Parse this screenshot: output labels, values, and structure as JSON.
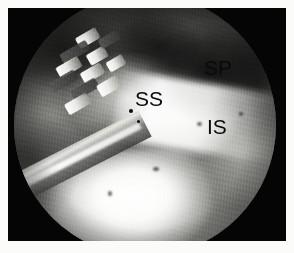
{
  "figure": {
    "kind": "arthroscopic-photograph",
    "modality_label": "shoulder arthroscopy",
    "frame": {
      "background_color": "#ffffff",
      "photo_background_color": "#050505",
      "width_px": 294,
      "height_px": 253,
      "margin_px": 8
    },
    "scope_field": {
      "shape": "circle",
      "diameter_px": 262,
      "cropped_edges": "top-and-bottom"
    },
    "labels": [
      {
        "id": "sp",
        "text": "SP",
        "meaning": "subscapularis / supraspinatus region marker",
        "color": "#0a0a0a",
        "x": 196,
        "y": 49
      },
      {
        "id": "ss",
        "text": "SS",
        "meaning": "supraspinatus tendon marker",
        "color": "#0a0a0a",
        "x": 127,
        "y": 80
      },
      {
        "id": "is",
        "text": "IS",
        "meaning": "infraspinatus tendon marker",
        "color": "#0a0a0a",
        "x": 199,
        "y": 108
      }
    ],
    "scene_elements": [
      {
        "name": "surgical-instrument",
        "description": "toothed grasper/rasp head with bright metallic teeth entering from upper left"
      },
      {
        "name": "instrument-shaft",
        "description": "straight metallic shaft running diagonally from left edge toward centre"
      },
      {
        "name": "tendon-band",
        "description": "bright fibrous tendon band across centre toward lower right"
      },
      {
        "name": "bright-mass",
        "description": "bright bursal / humeral head tissue occupying the lower portion"
      },
      {
        "name": "dark-recess-upper-right",
        "description": "dark subacromial recess in the upper right of the field"
      }
    ]
  }
}
